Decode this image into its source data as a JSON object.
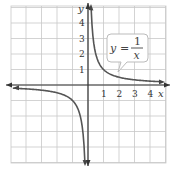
{
  "chart_data": {
    "type": "line",
    "title": "",
    "function": "y = 1/x",
    "annotation": {
      "text_lhs": "y",
      "text_eq": "=",
      "numerator": "1",
      "denominator": "x"
    },
    "xlabel": "x",
    "ylabel": "y",
    "xlim": [
      -5.5,
      5
    ],
    "ylim": [
      -5,
      5.2
    ],
    "x_ticks": [
      "1",
      "2",
      "3",
      "4"
    ],
    "y_ticks": [
      "1",
      "2",
      "3",
      "4"
    ],
    "grid": true,
    "series": [
      {
        "name": "y = 1/x (x > 0)",
        "x": [
          0.2,
          0.25,
          0.5,
          1,
          2,
          3,
          4,
          4.6
        ],
        "y": [
          5,
          4,
          2,
          1,
          0.5,
          0.333,
          0.25,
          0.217
        ]
      },
      {
        "name": "y = 1/x (x < 0)",
        "x": [
          -5.5,
          -4,
          -3,
          -2,
          -1,
          -0.5,
          -0.25,
          -0.2
        ],
        "y": [
          -0.18,
          -0.25,
          -0.333,
          -0.5,
          -1,
          -2,
          -4,
          -5
        ]
      }
    ]
  },
  "colors": {
    "grid": "#c8c8c8",
    "axis": "#333333",
    "curve": "#555555",
    "callout_border": "#bbbbbb"
  }
}
